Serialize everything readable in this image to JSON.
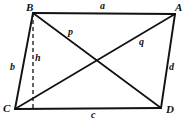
{
  "figure": {
    "type": "geometry-diagram",
    "shape": "parallelogram",
    "colors": {
      "stroke": "#111111",
      "background": "#ffffff",
      "label": "#111111"
    },
    "vertices": [
      {
        "key": "B",
        "label": "B",
        "x": 33,
        "y": 13,
        "label_x": 26,
        "label_y": 2
      },
      {
        "key": "A",
        "label": "A",
        "x": 175,
        "y": 14,
        "label_x": 175,
        "label_y": 2
      },
      {
        "key": "C",
        "label": "C",
        "x": 15,
        "y": 109,
        "label_x": 3,
        "label_y": 103
      },
      {
        "key": "D",
        "label": "D",
        "x": 161,
        "y": 108,
        "label_x": 166,
        "label_y": 104
      }
    ],
    "sides": [
      {
        "key": "a",
        "label": "a",
        "from": "B",
        "to": "A",
        "label_x": 100,
        "label_y": 1
      },
      {
        "key": "b",
        "label": "b",
        "from": "C",
        "to": "B",
        "label_x": 10,
        "label_y": 62
      },
      {
        "key": "c",
        "label": "c",
        "from": "C",
        "to": "D",
        "label_x": 91,
        "label_y": 110
      },
      {
        "key": "d",
        "label": "d",
        "from": "D",
        "to": "A",
        "label_x": 169,
        "label_y": 62
      }
    ],
    "diagonals": [
      {
        "key": "p",
        "label": "p",
        "from": "B",
        "to": "D",
        "label_x": 68,
        "label_y": 27
      },
      {
        "key": "q",
        "label": "q",
        "from": "C",
        "to": "A",
        "label_x": 139,
        "label_y": 37
      }
    ],
    "altitude": {
      "key": "h",
      "label": "h",
      "from": "B",
      "foot_x": 33,
      "foot_y": 109,
      "style": "dashed",
      "label_x": 35,
      "label_y": 53
    },
    "intersection": {
      "x": 96,
      "y": 61
    }
  }
}
